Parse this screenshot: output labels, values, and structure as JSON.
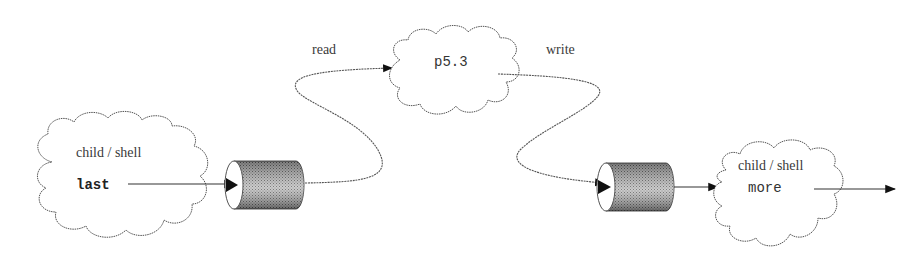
{
  "diagram": {
    "nodes": {
      "left_process": {
        "title": "child / shell",
        "command": "last"
      },
      "center_process": {
        "label": "p5.3"
      },
      "right_process": {
        "title": "child / shell",
        "command": "more"
      }
    },
    "edges": {
      "read_label": "read",
      "write_label": "write"
    },
    "pipes": [
      {
        "name": "pipe-1"
      },
      {
        "name": "pipe-2"
      }
    ]
  }
}
